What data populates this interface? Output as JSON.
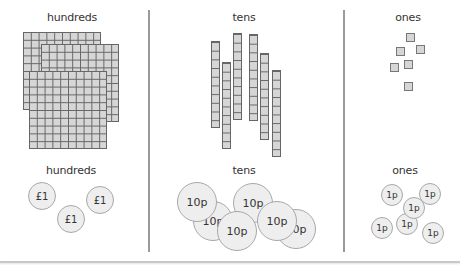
{
  "columns": [
    {
      "name": "hundreds",
      "top_label": "hundreds",
      "bottom_label": "hundreds"
    },
    {
      "name": "tens",
      "top_label": "tens",
      "bottom_label": "tens"
    },
    {
      "name": "ones",
      "top_label": "ones",
      "bottom_label": "ones"
    }
  ],
  "blocks": {
    "hundreds_count": 3,
    "tens_count": 6,
    "ones_count": 6
  },
  "coins": {
    "hundreds": [
      "£1",
      "£1",
      "£1"
    ],
    "tens": [
      "10p",
      "10p",
      "10p",
      "10p",
      "10p",
      "10p"
    ],
    "ones": [
      "1p",
      "1p",
      "1p",
      "1p",
      "1p",
      "1p"
    ]
  },
  "colors": {
    "block_fill": "#d6d6d6",
    "block_line": "#666666",
    "coin_fill": "#eeeeee",
    "coin_border": "#a8a8a8",
    "divider": "#9a9a9a"
  }
}
